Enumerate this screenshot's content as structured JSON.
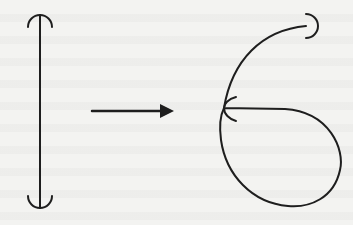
{
  "figure": {
    "colors": {
      "background": "#f3f3f1",
      "stroke": "#1e1e1e"
    },
    "left_shape": {
      "type": "vertical-segment-with-hooks",
      "x": 40,
      "y_top": 15,
      "y_bottom": 208,
      "hook_radius": 12
    },
    "arrow": {
      "x_start": 92,
      "x_end": 172,
      "y": 111,
      "direction": "right"
    },
    "right_shape": {
      "type": "loop-curve-with-hooks",
      "junction": [
        222,
        108
      ],
      "top_hook_end": [
        306,
        25
      ],
      "rightmost_x": 341,
      "bottom_y": 207
    }
  }
}
